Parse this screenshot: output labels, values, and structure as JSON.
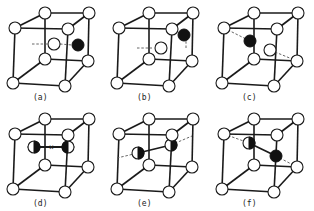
{
  "figure": {
    "panels": [
      {
        "id": "a",
        "label": "(a)",
        "col": 0,
        "row": 0,
        "defect": "open atom at body center, dark atom on right face",
        "style": "center-right"
      },
      {
        "id": "b",
        "label": "(b)",
        "col": 1,
        "row": 0,
        "defect": "open atom at center, dark atom near top right edge",
        "style": "center-top-right"
      },
      {
        "id": "c",
        "label": "(c)",
        "col": 2,
        "row": 0,
        "defect": "dark atom near top-left edge, open atom at center",
        "style": "top-left"
      },
      {
        "id": "d",
        "label": "(d)",
        "col": 0,
        "row": 1,
        "defect": "split dumbbell, two half-filled atoms horizontal",
        "style": "dumbbell-horizontal"
      },
      {
        "id": "e",
        "label": "(e)",
        "col": 1,
        "row": 1,
        "defect": "split dumbbell along diagonal",
        "style": "dumbbell-diagonal"
      },
      {
        "id": "f",
        "label": "(f)",
        "col": 2,
        "row": 1,
        "defect": "half-filled and dark atom bonded along body diagonal",
        "style": "dumbbell-body-diagonal"
      }
    ]
  },
  "colors": {
    "line": "#1a1a1a",
    "atom_fill": "#ffffff",
    "dark_atom": "#111111",
    "background": "#ffffff"
  }
}
